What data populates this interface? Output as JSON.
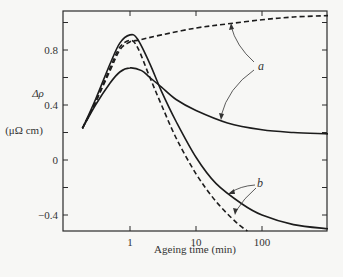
{
  "chart_data": {
    "type": "line",
    "title": "",
    "xlabel": "Ageing time (min)",
    "ylabel": "Δρ",
    "ylabel_unit": "(μΩ cm)",
    "xscale": "log",
    "xlim": [
      0.1,
      1000
    ],
    "ylim": [
      -0.5,
      1.1
    ],
    "x_ticks": [
      1,
      10,
      100
    ],
    "x_tick_labels": [
      "1",
      "10",
      "100"
    ],
    "y_ticks": [
      0.8,
      0.4,
      0,
      -0.4
    ],
    "y_tick_labels": [
      "0.8",
      "0.4",
      "0",
      "−0.4"
    ],
    "y_minor_ticks": [
      1.0,
      0.6,
      0.2,
      -0.2
    ],
    "grid": false,
    "annotations": [
      {
        "text": "a",
        "points_to": [
          "a-dashed",
          "a-solid"
        ]
      },
      {
        "text": "b",
        "points_to": [
          "b-solid",
          "b-dashed"
        ]
      }
    ],
    "series": [
      {
        "name": "a-dashed",
        "group": "a",
        "style": "dashed",
        "x": [
          0.19,
          0.3,
          0.5,
          0.7,
          1.0,
          1.3,
          3,
          10,
          30,
          100,
          300,
          1000
        ],
        "y": [
          0.23,
          0.42,
          0.65,
          0.8,
          0.86,
          0.87,
          0.91,
          0.96,
          0.99,
          1.02,
          1.04,
          1.05
        ]
      },
      {
        "name": "a-solid",
        "group": "a",
        "style": "solid",
        "x": [
          0.19,
          0.3,
          0.5,
          0.7,
          1.0,
          1.5,
          2,
          3,
          5,
          10,
          30,
          100,
          300,
          1000
        ],
        "y": [
          0.23,
          0.4,
          0.56,
          0.64,
          0.67,
          0.65,
          0.6,
          0.53,
          0.44,
          0.36,
          0.27,
          0.22,
          0.2,
          0.19
        ]
      },
      {
        "name": "b-solid",
        "group": "b",
        "style": "solid",
        "x": [
          0.19,
          0.3,
          0.5,
          0.7,
          1.0,
          1.3,
          2,
          3,
          5,
          10,
          20,
          50,
          100,
          300,
          1000
        ],
        "y": [
          0.23,
          0.44,
          0.7,
          0.85,
          0.91,
          0.88,
          0.7,
          0.5,
          0.28,
          0.02,
          -0.17,
          -0.32,
          -0.4,
          -0.47,
          -0.5
        ]
      },
      {
        "name": "b-dashed",
        "group": "b",
        "style": "dashed",
        "x": [
          0.19,
          0.3,
          0.5,
          0.7,
          1.0,
          1.3,
          2,
          3,
          5,
          10,
          20,
          40,
          60
        ],
        "y": [
          0.23,
          0.42,
          0.67,
          0.82,
          0.87,
          0.82,
          0.6,
          0.4,
          0.16,
          -0.1,
          -0.3,
          -0.45,
          -0.52
        ]
      }
    ]
  }
}
